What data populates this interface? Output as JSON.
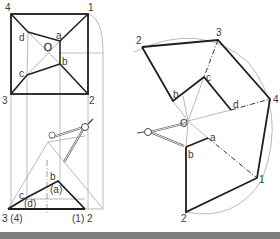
{
  "figure": {
    "colors": {
      "outline": "#1e1e1e",
      "construction": "#9a9a9a",
      "arc": "#a8a8a8",
      "label": "#3a3a3a",
      "footer_bar": "#7d7d7d"
    }
  },
  "plan_view": {
    "corners": {
      "c4": "4",
      "c1": "1",
      "c2": "2",
      "c3": "3"
    },
    "inner": {
      "a": "a",
      "b": "b",
      "c": "c",
      "d": "d"
    },
    "center": "O"
  },
  "elevation_view": {
    "base_left": "3 (4)",
    "base_right": "(1) 2",
    "top_left": "c",
    "top_left_hidden": "(d)",
    "top_right": "b",
    "top_right_hidden": "(a)"
  },
  "development_view": {
    "outer": {
      "p2_top": "2",
      "p3": "3",
      "p4": "4",
      "p1": "1",
      "p2_bottom": "2"
    },
    "inner": {
      "a": "a",
      "b_top": "b",
      "b_bottom": "b",
      "c": "c",
      "d": "d"
    },
    "center": "O"
  }
}
